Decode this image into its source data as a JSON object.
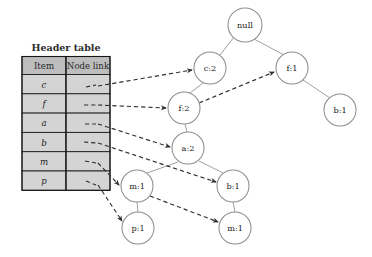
{
  "figure": {
    "kind": "fp-tree-with-header-table",
    "background_color": "#ffffff",
    "width": 372,
    "height": 257
  },
  "header_table": {
    "title": "Header table",
    "columns": [
      "Item",
      "Node link"
    ],
    "rows": [
      {
        "item": "c",
        "node_link": ""
      },
      {
        "item": "f",
        "node_link": ""
      },
      {
        "item": "a",
        "node_link": ""
      },
      {
        "item": "b",
        "node_link": ""
      },
      {
        "item": "m",
        "node_link": ""
      },
      {
        "item": "p",
        "node_link": ""
      }
    ],
    "header_fill": "#bdbdbd",
    "cell_fill": "#d4d4d4",
    "border_color": "#151515"
  },
  "tree": {
    "root_label": "null",
    "nodes": [
      {
        "id": "root",
        "label": "null",
        "item": "null",
        "count": "",
        "x": 245,
        "y": 25,
        "r": 17
      },
      {
        "id": "c2",
        "label": "c:2",
        "item": "c",
        "count": "2",
        "x": 210,
        "y": 68,
        "r": 16
      },
      {
        "id": "f1",
        "label": "f:1",
        "item": "f",
        "count": "1",
        "x": 292,
        "y": 68,
        "r": 16
      },
      {
        "id": "f2",
        "label": "f:2",
        "item": "f",
        "count": "2",
        "x": 184,
        "y": 108,
        "r": 16
      },
      {
        "id": "b1r",
        "label": "b:1",
        "item": "b",
        "count": "1",
        "x": 340,
        "y": 110,
        "r": 16
      },
      {
        "id": "a2",
        "label": "a:2",
        "item": "a",
        "count": "2",
        "x": 188,
        "y": 148,
        "r": 16
      },
      {
        "id": "m1l",
        "label": "m:1",
        "item": "m",
        "count": "1",
        "x": 137,
        "y": 186,
        "r": 16
      },
      {
        "id": "b1m",
        "label": "b:1",
        "item": "b",
        "count": "1",
        "x": 233,
        "y": 186,
        "r": 16
      },
      {
        "id": "p1",
        "label": "p:1",
        "item": "p",
        "count": "1",
        "x": 138,
        "y": 228,
        "r": 16
      },
      {
        "id": "m1r",
        "label": "m:1",
        "item": "m",
        "count": "1",
        "x": 235,
        "y": 228,
        "r": 16
      }
    ],
    "edges": [
      {
        "from": "root",
        "to": "c2"
      },
      {
        "from": "root",
        "to": "f1"
      },
      {
        "from": "c2",
        "to": "f2"
      },
      {
        "from": "f1",
        "to": "b1r"
      },
      {
        "from": "f2",
        "to": "a2"
      },
      {
        "from": "a2",
        "to": "m1l"
      },
      {
        "from": "a2",
        "to": "b1m"
      },
      {
        "from": "m1l",
        "to": "p1"
      },
      {
        "from": "b1m",
        "to": "m1r"
      }
    ],
    "node_stroke": "#8d8d8d",
    "node_fill": "#ffffff",
    "edge_color": "#9a9a9a"
  },
  "node_links": {
    "color": "#2e2e2e",
    "style": "dashed-with-arrow",
    "paths": [
      {
        "label": "c-link-to-c2",
        "from_row": "c",
        "to_node": "c2"
      },
      {
        "label": "f-link-to-f2",
        "from_row": "f",
        "to_node": "f2"
      },
      {
        "label": "a-link-to-a2",
        "from_row": "a",
        "to_node": "a2"
      },
      {
        "label": "b-link-to-b1m",
        "from_row": "b",
        "to_node": "b1m"
      },
      {
        "label": "m-link-to-m1l",
        "from_row": "m",
        "to_node": "m1l"
      },
      {
        "label": "p-link-to-p1",
        "from_row": "p",
        "to_node": "p1"
      },
      {
        "label": "f2-link-to-f1",
        "from_node": "f2",
        "to_node": "f1"
      },
      {
        "label": "m1l-link-to-m1r",
        "from_node": "m1l",
        "to_node": "m1r"
      }
    ]
  }
}
